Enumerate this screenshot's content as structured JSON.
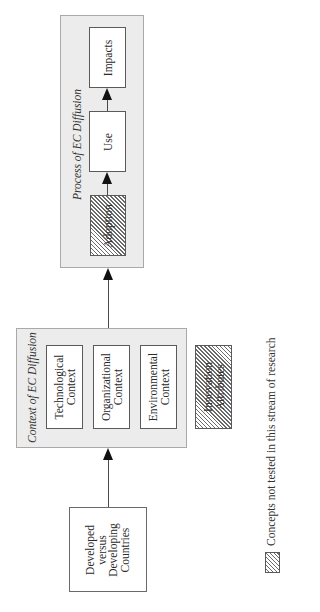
{
  "orientation": "rotated -90deg (landscape figure on portrait page)",
  "process_group": {
    "title": "Process of EC Diffusion",
    "boxes": [
      {
        "label": "Impacts",
        "hatched": false
      },
      {
        "label": "Use",
        "hatched": false
      },
      {
        "label": "Adoption",
        "hatched": true
      }
    ]
  },
  "context_group": {
    "title": "Context of EC Diffusion",
    "boxes": [
      {
        "line1": "Technological",
        "line2": "Context",
        "hatched": false
      },
      {
        "line1": "Organizational",
        "line2": "Context",
        "hatched": false
      },
      {
        "line1": "Environmental",
        "line2": "Context",
        "hatched": false
      }
    ]
  },
  "innovation_box": {
    "line1": "Innovation",
    "line2": "Attributes",
    "hatched": true
  },
  "countries_box": {
    "line1": "Developed",
    "line2": "versus",
    "line3": "Developing",
    "line4": "Countries"
  },
  "edges": [
    {
      "from": "Developed versus Developing Countries",
      "to": "Context of EC Diffusion"
    },
    {
      "from": "Context of EC Diffusion",
      "to": "Process of EC Diffusion"
    },
    {
      "from": "Adoption",
      "to": "Use"
    },
    {
      "from": "Use",
      "to": "Impacts"
    }
  ],
  "legend": {
    "swatch": "hatched",
    "label": "Concepts not tested in this stream of research"
  }
}
